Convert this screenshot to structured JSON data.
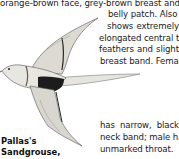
{
  "text_lines": [
    "orange-brown face, grey-brown breast and dark",
    "belly patch. Also",
    "shows extremely",
    "elongated central tail",
    "feathers and slight",
    "breast band. Female",
    "has narrow, black",
    "neck band; male has",
    "unmarked throat."
  ],
  "justified": {
    "line2": [
      "shows",
      "extremely"
    ],
    "line4": [
      "feathers",
      "and",
      "slight"
    ],
    "line6": [
      "has",
      "narrow,",
      "black"
    ]
  },
  "caption": {
    "line1": "Pallas's",
    "line2": "Sandgrouse,"
  },
  "illustration": {
    "subject": "Pallas's Sandgrouse in flight",
    "colors": {
      "body": "#e4e2dc",
      "shade": "#b9b6ae",
      "belly_patch": "#1c1c1c",
      "outline": "#4a4a4a"
    }
  }
}
